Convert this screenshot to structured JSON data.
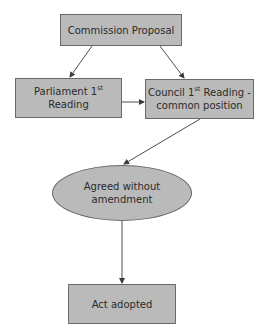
{
  "diagram": {
    "type": "flowchart",
    "colors": {
      "node_fill": "#bababa",
      "node_border": "#6a6a6a",
      "text": "#2a2a2a",
      "edge": "#3a3a3a",
      "background": "#ffffff"
    },
    "nodes": {
      "commission": {
        "shape": "rectangle",
        "label": "Commission Proposal"
      },
      "parliament": {
        "shape": "rectangle",
        "label_main": "Parliament 1",
        "label_sup": "st",
        "label_rest": " Reading"
      },
      "council": {
        "shape": "rectangle",
        "label_main": "Council 1",
        "label_sup": "st",
        "label_rest": " Reading -",
        "label_line2": "common position"
      },
      "agreed": {
        "shape": "ellipse",
        "label": "Agreed without amendment"
      },
      "adopted": {
        "shape": "rectangle",
        "label": "Act adopted"
      }
    },
    "edges": [
      {
        "from": "commission",
        "to": "parliament"
      },
      {
        "from": "commission",
        "to": "council"
      },
      {
        "from": "parliament",
        "to": "council"
      },
      {
        "from": "council",
        "to": "agreed"
      },
      {
        "from": "agreed",
        "to": "adopted"
      }
    ]
  }
}
